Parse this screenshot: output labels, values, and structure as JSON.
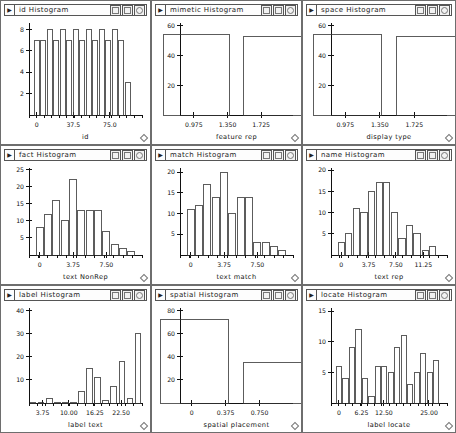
{
  "window": {
    "controls": [
      "minimize-box-icon",
      "maximize-box-icon",
      "close-circle-icon"
    ],
    "menu_arrow": "▶",
    "resize_handle": "resize-handle-icon"
  },
  "panels": [
    {
      "id": "id-histogram",
      "title": "id Histogram",
      "chart_data": {
        "type": "bar",
        "title": "id Histogram",
        "xlabel": "id",
        "ylabel": "",
        "xticks": [
          "0",
          "37.5",
          "75.0"
        ],
        "xtick_values": [
          0,
          37.5,
          75.0
        ],
        "yticks": [
          "2",
          "4",
          "6",
          "8"
        ],
        "ytick_values": [
          2,
          4,
          6,
          8
        ],
        "ylim": [
          0,
          8.6
        ],
        "xlim": [
          -8,
          108
        ],
        "grid": false,
        "legend": "none",
        "categories": [
          "0",
          "6.7",
          "13.3",
          "20",
          "26.7",
          "33.3",
          "40",
          "46.7",
          "53.3",
          "60",
          "66.7",
          "73.3",
          "80",
          "86.7",
          "93.3"
        ],
        "values": [
          7,
          7,
          8,
          7,
          8,
          7,
          8,
          7,
          8,
          7,
          8,
          7,
          8,
          7,
          3
        ]
      }
    },
    {
      "id": "mimetic-histogram",
      "title": "mimetic Histogram",
      "chart_data": {
        "type": "bar",
        "title": "mimetic Histogram",
        "xlabel": "feature rep",
        "ylabel": "",
        "xticks": [
          "0.975",
          "1.350",
          "1.725"
        ],
        "xtick_values": [
          0.975,
          1.35,
          1.725
        ],
        "yticks": [
          "20",
          "40",
          "60"
        ],
        "ytick_values": [
          20,
          40,
          60
        ],
        "ylim": [
          0,
          62
        ],
        "xlim": [
          0.82,
          2.08
        ],
        "grid": false,
        "legend": "none",
        "categories": [
          "1.0",
          "1.9"
        ],
        "values": [
          54,
          53
        ]
      }
    },
    {
      "id": "space-histogram",
      "title": "space Histogram",
      "chart_data": {
        "type": "bar",
        "title": "space Histogram",
        "xlabel": "display type",
        "ylabel": "",
        "xticks": [
          "0.975",
          "1.350",
          "1.725"
        ],
        "xtick_values": [
          0.975,
          1.35,
          1.725
        ],
        "yticks": [
          "20",
          "40",
          "60"
        ],
        "ytick_values": [
          20,
          40,
          60
        ],
        "ylim": [
          0,
          62
        ],
        "xlim": [
          0.82,
          2.08
        ],
        "grid": false,
        "legend": "none",
        "categories": [
          "1.0",
          "1.9"
        ],
        "values": [
          54,
          53
        ]
      }
    },
    {
      "id": "fact-histogram",
      "title": "fact Histogram",
      "chart_data": {
        "type": "bar",
        "title": "fact Histogram",
        "xlabel": "text NonRep",
        "ylabel": "",
        "xticks": [
          "0",
          "3.75",
          "7.50"
        ],
        "xtick_values": [
          0,
          3.75,
          7.5
        ],
        "yticks": [
          "5",
          "10",
          "15",
          "20",
          "25"
        ],
        "ytick_values": [
          5,
          10,
          15,
          20,
          25
        ],
        "ylim": [
          0,
          25.5
        ],
        "xlim": [
          -1.2,
          11.5
        ],
        "grid": false,
        "legend": "none",
        "categories": [
          "0",
          "0.94",
          "1.88",
          "2.81",
          "3.75",
          "4.69",
          "5.63",
          "6.56",
          "7.5",
          "8.44",
          "9.38",
          "10.3"
        ],
        "values": [
          8,
          12,
          16,
          10,
          22,
          13,
          13,
          13,
          7,
          3,
          2,
          1
        ]
      }
    },
    {
      "id": "match-histogram",
      "title": "match Histogram",
      "chart_data": {
        "type": "bar",
        "title": "match Histogram",
        "xlabel": "text match",
        "ylabel": "",
        "xticks": [
          "0",
          "3.75",
          "7.50"
        ],
        "xtick_values": [
          0,
          3.75,
          7.5
        ],
        "yticks": [
          "5",
          "10",
          "15",
          "20"
        ],
        "ytick_values": [
          5,
          10,
          15,
          20
        ],
        "ylim": [
          0,
          21
        ],
        "xlim": [
          -1.2,
          11.5
        ],
        "grid": false,
        "legend": "none",
        "categories": [
          "0",
          "0.94",
          "1.88",
          "2.81",
          "3.75",
          "4.69",
          "5.63",
          "6.56",
          "7.5",
          "8.44",
          "9.38",
          "10.3"
        ],
        "values": [
          11,
          12,
          17,
          14,
          20,
          10,
          14,
          14,
          3,
          3,
          2,
          1
        ]
      }
    },
    {
      "id": "name-histogram",
      "title": "name Histogram",
      "chart_data": {
        "type": "bar",
        "title": "name Histogram",
        "xlabel": "text rep",
        "ylabel": "",
        "xticks": [
          "0",
          "3.75",
          "7.50",
          "11.25"
        ],
        "xtick_values": [
          0,
          3.75,
          7.5,
          11.25
        ],
        "yticks": [
          "5",
          "10",
          "15",
          "20"
        ],
        "ytick_values": [
          5,
          10,
          15,
          20
        ],
        "ylim": [
          0,
          20.5
        ],
        "xlim": [
          -1.4,
          14.5
        ],
        "grid": false,
        "legend": "none",
        "categories": [
          "0",
          "1.04",
          "2.08",
          "3.13",
          "4.17",
          "5.21",
          "6.25",
          "7.29",
          "8.33",
          "9.38",
          "10.4",
          "11.5",
          "12.5"
        ],
        "values": [
          3,
          5,
          11,
          10,
          15,
          17,
          17,
          10,
          4,
          7,
          5,
          1,
          2
        ]
      }
    },
    {
      "id": "label-histogram",
      "title": "label Histogram",
      "chart_data": {
        "type": "bar",
        "title": "label Histogram",
        "xlabel": "label text",
        "ylabel": "",
        "xticks": [
          "3.75",
          "10.00",
          "16.25",
          "22.50"
        ],
        "xtick_values": [
          3.75,
          10.0,
          16.25,
          22.5
        ],
        "yticks": [
          "10",
          "20",
          "30",
          "40"
        ],
        "ytick_values": [
          10,
          20,
          30,
          40
        ],
        "ylim": [
          0,
          41
        ],
        "xlim": [
          0.5,
          27.5
        ],
        "grid": false,
        "legend": "none",
        "categories": [
          "2",
          "4",
          "6",
          "8",
          "10",
          "12",
          "14",
          "16",
          "18",
          "20",
          "22",
          "24",
          "26"
        ],
        "values": [
          0.3,
          0.3,
          2,
          0.3,
          0.3,
          0.3,
          5,
          15,
          11,
          1,
          7,
          18,
          2,
          30
        ],
        "note": "long tail of near-zero bins then sharp rise at right"
      }
    },
    {
      "id": "spatial-histogram",
      "title": "spatial Histogram",
      "chart_data": {
        "type": "bar",
        "title": "spatial Histogram",
        "xlabel": "spatial placement",
        "ylabel": "",
        "xticks": [
          "0",
          "0.375",
          "0.750"
        ],
        "xtick_values": [
          0,
          0.375,
          0.75
        ],
        "yticks": [
          "20",
          "40",
          "60",
          "80"
        ],
        "ytick_values": [
          20,
          40,
          60,
          80
        ],
        "ylim": [
          0,
          82
        ],
        "xlim": [
          -0.13,
          1.12
        ],
        "grid": false,
        "legend": "none",
        "categories": [
          "0.03",
          "0.95"
        ],
        "values": [
          72,
          35
        ]
      }
    },
    {
      "id": "locate-histogram",
      "title": "locate Histogram",
      "chart_data": {
        "type": "bar",
        "title": "locate Histogram",
        "xlabel": "label locate",
        "ylabel": "",
        "xticks": [
          "0",
          "6.25",
          "12.50",
          "25.00"
        ],
        "xtick_values": [
          0,
          6.25,
          12.5,
          25.0
        ],
        "yticks": [
          "5",
          "10",
          "15"
        ],
        "ytick_values": [
          5,
          10,
          15
        ],
        "ylim": [
          0,
          15.5
        ],
        "xlim": [
          -2.2,
          30
        ],
        "grid": false,
        "legend": "none",
        "categories": [
          "0",
          "1.8",
          "3.6",
          "5.4",
          "7.2",
          "9",
          "10.8",
          "12.6",
          "14.4",
          "16.2",
          "18",
          "19.8",
          "21.6",
          "23.4",
          "25.2",
          "27"
        ],
        "values": [
          6,
          4,
          9,
          12,
          4,
          1,
          6,
          6,
          5,
          9,
          11,
          3,
          5,
          8,
          5,
          7
        ]
      }
    }
  ]
}
